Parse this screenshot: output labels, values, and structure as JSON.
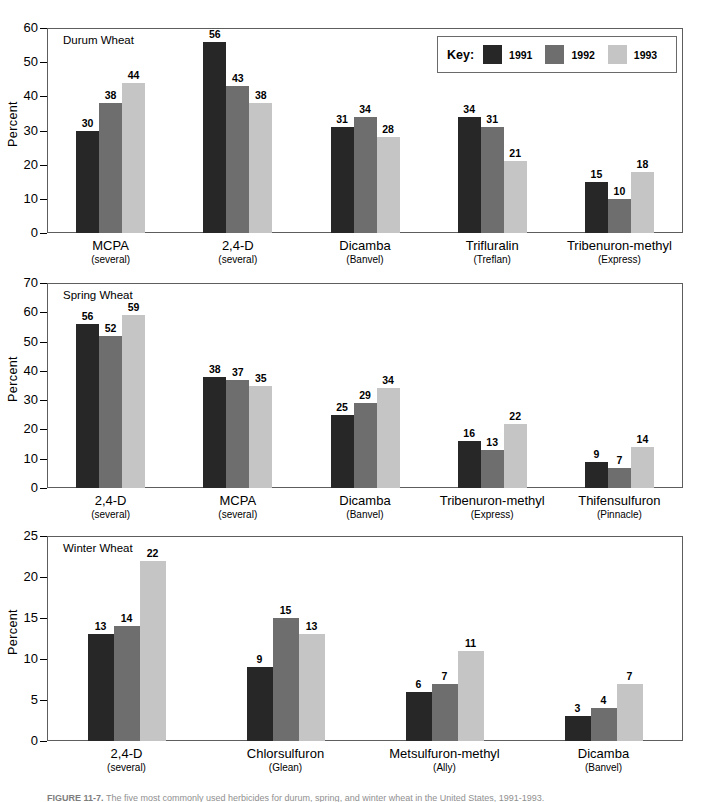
{
  "colors": {
    "series_1991": "#272727",
    "series_1992": "#6e6e6e",
    "series_1993": "#c5c5c5",
    "frame": "#5d5d5d",
    "axis": "#000000"
  },
  "legend": {
    "key_label": "Key:",
    "items": [
      {
        "label": "1991",
        "color": "#272727"
      },
      {
        "label": "1992",
        "color": "#6e6e6e"
      },
      {
        "label": "1993",
        "color": "#c5c5c5"
      }
    ]
  },
  "caption": {
    "figure_label": "FIGURE 11-7.",
    "text": "The five most commonly used herbicides for durum, spring, and winter wheat in the United States, 1991-1993."
  },
  "chart_data": [
    {
      "type": "bar",
      "title": "Durum Wheat",
      "ylabel": "Percent",
      "xlabel": "",
      "ylim": [
        0,
        60
      ],
      "yticks": [
        0,
        10,
        20,
        30,
        40,
        50,
        60
      ],
      "grid": false,
      "legend_position": "top-right",
      "categories": [
        "MCPA",
        "2,4-D",
        "Dicamba",
        "Trifluralin",
        "Tribenuron-methyl"
      ],
      "category_subs": [
        "(several)",
        "(several)",
        "(Banvel)",
        "(Treflan)",
        "(Express)"
      ],
      "series": [
        {
          "name": "1991",
          "values": [
            30,
            56,
            31,
            34,
            15
          ]
        },
        {
          "name": "1992",
          "values": [
            38,
            43,
            34,
            31,
            10
          ]
        },
        {
          "name": "1993",
          "values": [
            44,
            38,
            28,
            21,
            18
          ]
        }
      ]
    },
    {
      "type": "bar",
      "title": "Spring Wheat",
      "ylabel": "Percent",
      "xlabel": "",
      "ylim": [
        0,
        70
      ],
      "yticks": [
        0,
        10,
        20,
        30,
        40,
        50,
        60,
        70
      ],
      "grid": false,
      "legend_position": "none",
      "categories": [
        "2,4-D",
        "MCPA",
        "Dicamba",
        "Tribenuron-methyl",
        "Thifensulfuron"
      ],
      "category_subs": [
        "(several)",
        "(several)",
        "(Banvel)",
        "(Express)",
        "(Pinnacle)"
      ],
      "series": [
        {
          "name": "1991",
          "values": [
            56,
            38,
            25,
            16,
            9
          ]
        },
        {
          "name": "1992",
          "values": [
            52,
            37,
            29,
            13,
            7
          ]
        },
        {
          "name": "1993",
          "values": [
            59,
            35,
            34,
            22,
            14
          ]
        }
      ]
    },
    {
      "type": "bar",
      "title": "Winter Wheat",
      "ylabel": "Percent",
      "xlabel": "",
      "ylim": [
        0,
        25
      ],
      "yticks": [
        0,
        5,
        10,
        15,
        20,
        25
      ],
      "grid": false,
      "legend_position": "none",
      "categories": [
        "2,4-D",
        "Chlorsulfuron",
        "Metsulfuron-methyl",
        "Dicamba"
      ],
      "category_subs": [
        "(several)",
        "(Glean)",
        "(Ally)",
        "(Banvel)"
      ],
      "series": [
        {
          "name": "1991",
          "values": [
            13,
            9,
            6,
            3
          ]
        },
        {
          "name": "1992",
          "values": [
            14,
            15,
            7,
            4
          ]
        },
        {
          "name": "1993",
          "values": [
            22,
            13,
            11,
            7
          ]
        }
      ]
    }
  ]
}
